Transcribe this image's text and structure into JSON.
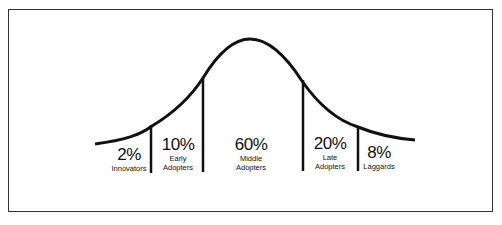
{
  "segments": [
    {
      "percent": "2%",
      "label_line1": "Innovators",
      "label_line2": ""
    },
    {
      "percent": "10%",
      "label_line1": "Early",
      "label_line2": "Adopters"
    },
    {
      "percent": "60%",
      "label_line1": "Middle",
      "label_line2": "Adopters"
    },
    {
      "percent": "20%",
      "label_line1": "Late",
      "label_line2": "Adopters"
    },
    {
      "percent": "8%",
      "label_line1": "Laggards",
      "label_line2": ""
    }
  ],
  "colors": {
    "line": "#111111",
    "border": "#333333",
    "background": "#ffffff"
  }
}
